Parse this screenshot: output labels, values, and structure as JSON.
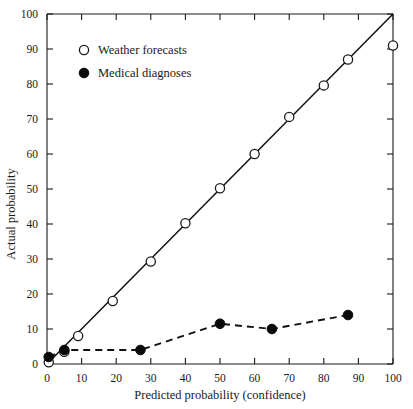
{
  "chart_data": {
    "type": "scatter",
    "title": "",
    "xlabel": "Predicted probability (confidence)",
    "ylabel": "Actual probability",
    "xlim": [
      0,
      100
    ],
    "ylim": [
      0,
      100
    ],
    "xticks": [
      0,
      10,
      20,
      30,
      40,
      50,
      60,
      70,
      80,
      90,
      100
    ],
    "yticks": [
      0,
      10,
      20,
      30,
      40,
      50,
      60,
      70,
      80,
      90,
      100
    ],
    "grid": false,
    "legend_position": "top-left-inside",
    "reference_line": {
      "name": "perfect calibration",
      "from": [
        0,
        0
      ],
      "to": [
        100,
        100
      ],
      "style": "solid"
    },
    "series": [
      {
        "name": "Weather forecasts",
        "marker": "open-circle",
        "line": "none",
        "points": [
          [
            0.5,
            0.5
          ],
          [
            5,
            3.5
          ],
          [
            9,
            8
          ],
          [
            19,
            18
          ],
          [
            30,
            29.3
          ],
          [
            40,
            40.2
          ],
          [
            50,
            50.2
          ],
          [
            60,
            60
          ],
          [
            70,
            70.6
          ],
          [
            80,
            79.6
          ],
          [
            87,
            87
          ],
          [
            100,
            91
          ]
        ]
      },
      {
        "name": "Medical diagnoses",
        "marker": "filled-circle",
        "line": "dashed",
        "points": [
          [
            0.5,
            2
          ],
          [
            5,
            4
          ],
          [
            27,
            4
          ],
          [
            50,
            11.5
          ],
          [
            65,
            10
          ],
          [
            87,
            14
          ]
        ]
      }
    ]
  },
  "legend": {
    "items": [
      {
        "label": "Weather forecasts",
        "marker": "open-circle"
      },
      {
        "label": "Medical diagnoses",
        "marker": "filled-circle"
      }
    ]
  },
  "axes": {
    "x_tick_labels": [
      "0",
      "10",
      "20",
      "30",
      "40",
      "50",
      "60",
      "70",
      "80",
      "90",
      "100"
    ],
    "y_tick_labels": [
      "0",
      "10",
      "20",
      "30",
      "40",
      "50",
      "60",
      "70",
      "80",
      "90",
      "100"
    ],
    "x_title": "Predicted probability (confidence)",
    "y_title": "Actual probability"
  }
}
